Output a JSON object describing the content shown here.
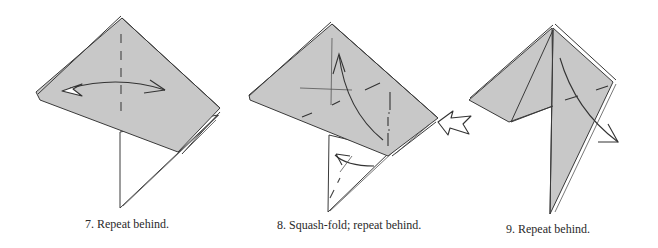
{
  "figure": {
    "type": "origami-instruction-diagram",
    "colors": {
      "paper": "#c8c8c8",
      "line": "#3a3a3a",
      "background": "#ffffff"
    },
    "steps": [
      {
        "number": "7.",
        "caption": "7.  Repeat behind.",
        "symbols": [
          "valley-fold-line",
          "fold-and-unfold-arrow"
        ]
      },
      {
        "number": "8.",
        "caption": "8.  Squash-fold; repeat behind.",
        "symbols": [
          "valley-fold-lines",
          "mountain-fold-line",
          "fold-arrow",
          "push-arrow"
        ]
      },
      {
        "number": "9.",
        "caption": "9.  Repeat behind.",
        "symbols": [
          "valley-fold-line",
          "fold-arrow"
        ]
      }
    ]
  }
}
